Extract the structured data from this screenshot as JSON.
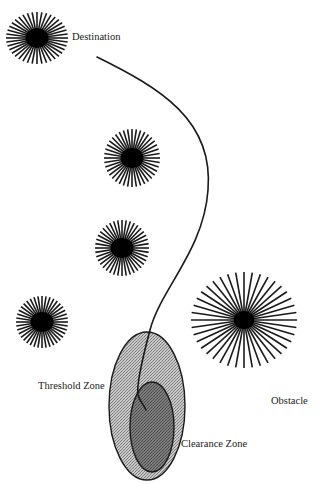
{
  "diagram": {
    "type": "path-planning-obstacle-diagram",
    "labels": {
      "destination": "Destination",
      "threshold_zone": "Threshold Zone",
      "obstacle": "Obstacle",
      "clearance_zone": "Clearance Zone"
    },
    "colors": {
      "background": "#ffffff",
      "ink": "#1a1a1a",
      "threshold_fill": "#b0b0b0",
      "clearance_fill": "#6e6e6e"
    },
    "stars": [
      {
        "id": "destination",
        "cx": 37,
        "cy": 38,
        "rx": 31,
        "ry": 26,
        "core": 10,
        "rays": 40
      },
      {
        "id": "obstacle-1",
        "cx": 132,
        "cy": 158,
        "rx": 28,
        "ry": 29,
        "core": 10,
        "rays": 40
      },
      {
        "id": "obstacle-2",
        "cx": 122,
        "cy": 248,
        "rx": 27,
        "ry": 28,
        "core": 10,
        "rays": 40
      },
      {
        "id": "obstacle-3",
        "cx": 42,
        "cy": 322,
        "rx": 26,
        "ry": 26,
        "core": 10,
        "rays": 40
      },
      {
        "id": "obstacle-large",
        "cx": 244,
        "cy": 320,
        "rx": 53,
        "ry": 48,
        "core": 9,
        "rays": 40
      }
    ],
    "threshold_zone": {
      "cx": 147,
      "cy": 406,
      "rx": 38,
      "ry": 74
    },
    "clearance_zone": {
      "cx": 152,
      "cy": 427,
      "rx": 22,
      "ry": 45
    },
    "path": "M 97 57 C 160 88, 214 120, 208 190 C 204 250, 160 290, 150 330 C 142 360, 136 385, 138 395 C 140 402, 144 405, 146 410"
  }
}
